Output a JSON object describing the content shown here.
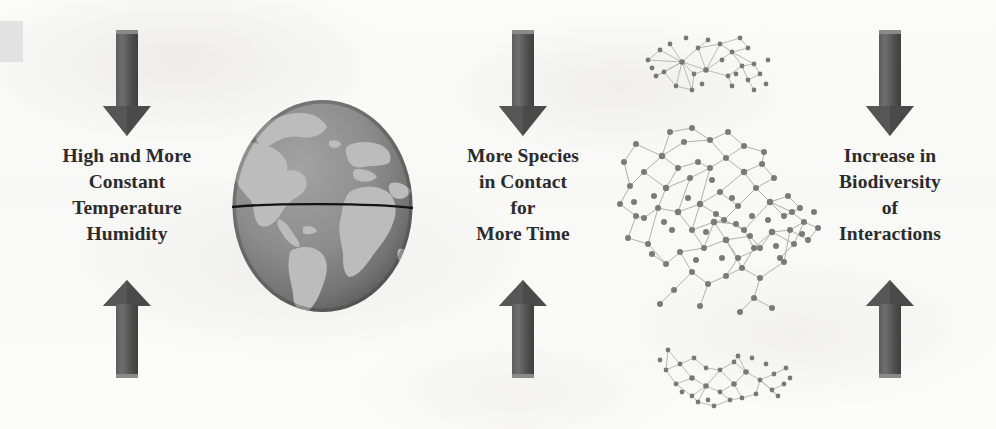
{
  "figure": {
    "type": "conceptual-flow-diagram",
    "panels": [
      {
        "id": "climate",
        "caption_lines": [
          "High and More",
          "Constant",
          "Temperature",
          "Humidity"
        ],
        "icon": "none",
        "arrow_down": "down-arrow",
        "arrow_up": "up-arrow"
      },
      {
        "id": "contact",
        "caption_lines": [
          "More Species",
          "in Contact",
          "for",
          "More Time"
        ],
        "icon": "globe-earth",
        "arrow_down": "down-arrow",
        "arrow_up": "up-arrow"
      },
      {
        "id": "biodiversity",
        "caption_lines": [
          "Increase in",
          "Biodiversity",
          "of",
          "Interactions"
        ],
        "icon": "interaction-networks",
        "arrow_down": "down-arrow",
        "arrow_up": "up-arrow"
      }
    ]
  },
  "colors": {
    "background": "#fdfdfc",
    "arrow_dark": "#4a4a4a",
    "arrow_light": "#6e6e6e",
    "text": "#2b2b2b",
    "globe_ocean": "#8e8e8e",
    "globe_land": "#b9b9b9",
    "globe_shadow": "#6a6a6a",
    "equator_line": "#141414",
    "network_node": "#7d7d7d",
    "network_edge": "#b0b0b0",
    "corner_block": "#e2e2e2"
  },
  "globe": {
    "label": "globe-earth",
    "features": [
      "North America",
      "South America",
      "Atlantic Ocean",
      "Africa",
      "Europe",
      "equator line"
    ]
  },
  "networks": [
    {
      "label": "network-top",
      "node_count": 30,
      "density": "sparse"
    },
    {
      "label": "network-main",
      "node_count": 88,
      "density": "dense"
    },
    {
      "label": "network-bottom",
      "node_count": 32,
      "density": "sparse"
    }
  ]
}
